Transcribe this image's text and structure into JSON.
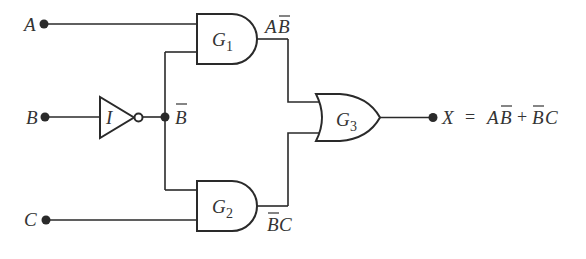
{
  "diagram": {
    "type": "logic-circuit",
    "colors": {
      "line": "#2a2a2a",
      "text": "#333333",
      "background": "#ffffff"
    },
    "inputs": [
      {
        "id": "A",
        "label": "A"
      },
      {
        "id": "B",
        "label": "B"
      },
      {
        "id": "C",
        "label": "C"
      }
    ],
    "inverter": {
      "id": "I",
      "label": "I",
      "output_label": "B",
      "output_label_overbar": true
    },
    "gates": [
      {
        "id": "G1",
        "type": "AND",
        "label": "G",
        "subscript": "1",
        "inputs": [
          "A",
          "B̄"
        ],
        "output_label": "AB̄"
      },
      {
        "id": "G2",
        "type": "AND",
        "label": "G",
        "subscript": "2",
        "inputs": [
          "B̄",
          "C"
        ],
        "output_label": "B̄C"
      },
      {
        "id": "G3",
        "type": "OR",
        "label": "G",
        "subscript": "3",
        "inputs": [
          "AB̄",
          "B̄C"
        ],
        "output_label": "X"
      }
    ],
    "g1_out": {
      "p1": "A",
      "p2": "B"
    },
    "g2_out": {
      "p1": "B",
      "p2": "C"
    },
    "output": {
      "label": "X",
      "equals": "=",
      "expr_t1a": "A",
      "expr_t1b": "B",
      "plus": "+",
      "expr_t2a": "B",
      "expr_t2b": "C"
    }
  }
}
